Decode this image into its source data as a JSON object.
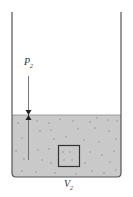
{
  "diagram": {
    "pressure_label": "P",
    "pressure_subscript": "2",
    "volume_label": "V",
    "volume_subscript": "2",
    "colors": {
      "wall": "#555555",
      "liquid": "#c8c8c8",
      "dots": "#7a7a7a",
      "box": "#333333",
      "arrow": "#333333"
    }
  }
}
